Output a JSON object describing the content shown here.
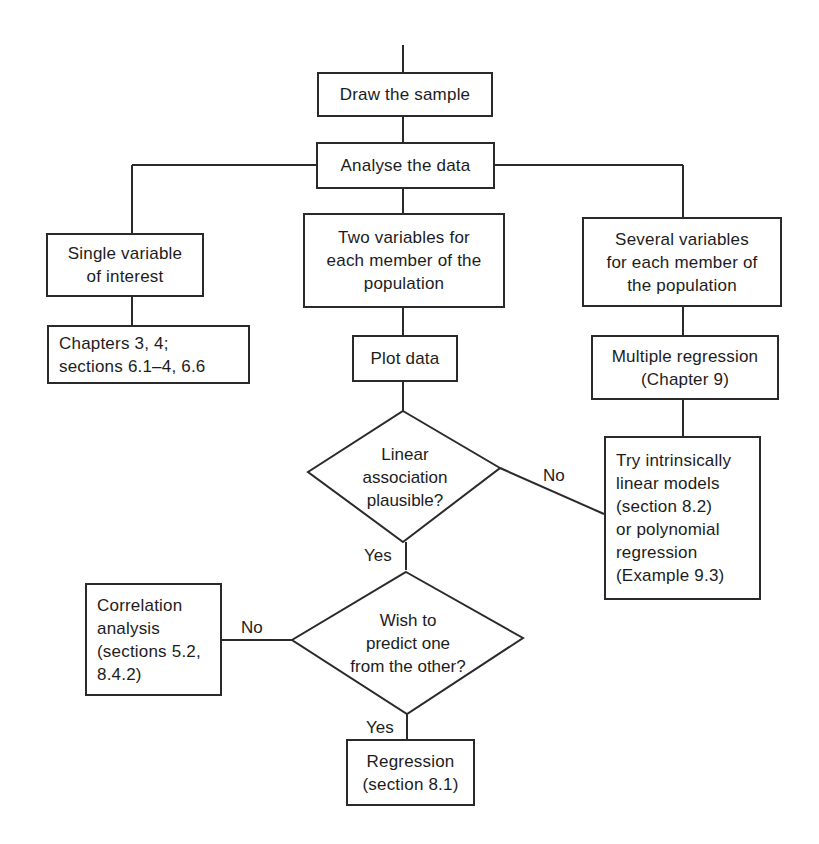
{
  "diagram": {
    "nodes": {
      "draw_sample": "Draw the sample",
      "analyse_data": "Analyse the data",
      "single_variable": "Single variable\nof interest",
      "two_variables": "Two variables for\neach member of the\npopulation",
      "several_variables": "Several variables\nfor each member of\nthe population",
      "chapters_ref": "Chapters 3, 4;\nsections 6.1–4, 6.6",
      "plot_data": "Plot data",
      "multiple_regression": "Multiple regression\n(Chapter 9)",
      "linear_association": "Linear\nassociation\nplausible?",
      "try_models": "Try intrinsically\nlinear models\n(section 8.2)\nor polynomial\nregression\n(Example 9.3)",
      "wish_predict": "Wish to\npredict one\nfrom the other?",
      "correlation": "Correlation\nanalysis\n(sections 5.2,\n8.4.2)",
      "regression": "Regression\n(section 8.1)"
    },
    "edge_labels": {
      "linear_no": "No",
      "linear_yes": "Yes",
      "predict_no": "No",
      "predict_yes": "Yes"
    },
    "colors": {
      "line": "#2a2a2a",
      "background": "#ffffff"
    }
  }
}
